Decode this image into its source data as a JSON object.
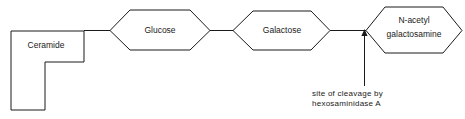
{
  "diagram": {
    "background_color": "#ffffff",
    "stroke_color": "#1a1a1a",
    "nodes": [
      {
        "id": "ceramide",
        "label": "Ceramide",
        "shape": "l-block"
      },
      {
        "id": "glucose",
        "label": "Glucose",
        "shape": "hexagon"
      },
      {
        "id": "galactose",
        "label": "Galactose",
        "shape": "hexagon"
      },
      {
        "id": "n-acetyl-galactosamine",
        "label_line_1": "N-acetyl",
        "label_line_2": "galactosamine",
        "shape": "hexagon"
      }
    ],
    "annotation": {
      "line_1": "site of cleavage by",
      "line_2": "hexosaminidase  A",
      "points_to": "n-acetyl-galactosamine"
    }
  }
}
